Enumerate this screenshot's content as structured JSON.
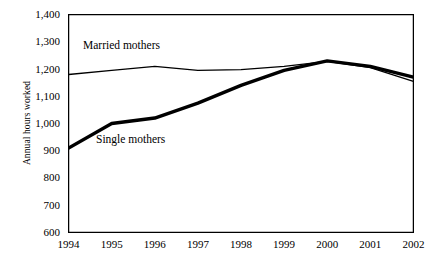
{
  "chart_data": {
    "type": "line",
    "title": "",
    "xlabel": "",
    "ylabel": "Annual hours worked",
    "x": [
      1994,
      1995,
      1996,
      1997,
      1998,
      1999,
      2000,
      2001,
      2002
    ],
    "categories": [
      "1994",
      "1995",
      "1996",
      "1997",
      "1998",
      "1999",
      "2000",
      "2001",
      "2002"
    ],
    "ylim": [
      600,
      1400
    ],
    "yticks": [
      600,
      700,
      800,
      900,
      1000,
      1100,
      1200,
      1300,
      1400
    ],
    "ytick_labels": [
      "600",
      "700",
      "800",
      "900",
      "1,000",
      "1,100",
      "1,200",
      "1,300",
      "1,400"
    ],
    "grid": false,
    "legend_position": "inline-annotations",
    "series": [
      {
        "name": "Married mothers",
        "values": [
          1180,
          1195,
          1210,
          1195,
          1198,
          1210,
          1228,
          1205,
          1155
        ],
        "color": "#000000",
        "line_width": 1.3,
        "style": "thin"
      },
      {
        "name": "Single mothers",
        "values": [
          910,
          1000,
          1020,
          1075,
          1140,
          1195,
          1230,
          1210,
          1170
        ],
        "color": "#000000",
        "line_width": 3.4,
        "style": "thick"
      }
    ],
    "annotations": [
      {
        "text": "Married mothers",
        "series": "Married mothers"
      },
      {
        "text": "Single mothers",
        "series": "Single mothers"
      }
    ],
    "axis_color": "#000000",
    "background": "#ffffff"
  }
}
